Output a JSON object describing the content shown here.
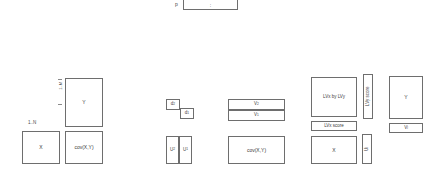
{
  "diagram": {
    "top": {
      "label": "p",
      "box_text": ":"
    },
    "panel_left": {
      "row_label": "1..N",
      "col_label": "1..M",
      "boxes": [
        {
          "name": "y-matrix",
          "text": "Y"
        },
        {
          "name": "x-matrix",
          "text": "X"
        },
        {
          "name": "cov-matrix",
          "text": "cov(X,Y)"
        }
      ]
    },
    "panel_middle": {
      "boxes": [
        {
          "name": "d2",
          "text": "d",
          "sub": "2"
        },
        {
          "name": "d1",
          "text": "d",
          "sub": "1"
        },
        {
          "name": "v2",
          "text": "V",
          "sub": "2"
        },
        {
          "name": "v1",
          "text": "V",
          "sub": "1"
        },
        {
          "name": "u2",
          "text": "U",
          "sub": "2"
        },
        {
          "name": "u1",
          "text": "U",
          "sub": "1"
        },
        {
          "name": "cov-matrix",
          "text": "cov(X,Y)"
        }
      ]
    },
    "panel_right": {
      "boxes": [
        {
          "name": "lvx-by-lvy",
          "text": "LVx by LVy"
        },
        {
          "name": "lvy-score",
          "text": "LVy score"
        },
        {
          "name": "lvx-score",
          "text": "LVx score"
        },
        {
          "name": "y-matrix",
          "text": "Y"
        },
        {
          "name": "vj-vector",
          "text": "V",
          "sub": "j"
        },
        {
          "name": "x-matrix",
          "text": "X"
        },
        {
          "name": "uj-vector",
          "text": "U",
          "sub": "j"
        }
      ]
    }
  }
}
